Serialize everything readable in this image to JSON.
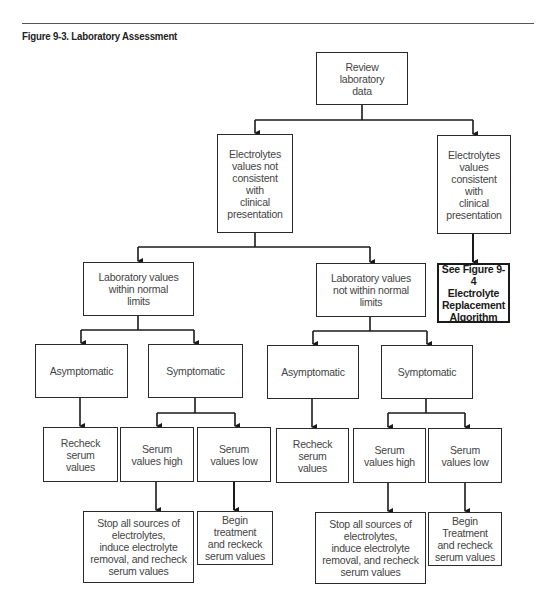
{
  "figure": {
    "title": "Figure 9-3. Laboratory Assessment"
  },
  "nodes": {
    "review": {
      "label": "Review\nlaboratory\ndata"
    },
    "not_consistent": {
      "label": "Electrolytes\nvalues not\nconsistent\nwith\nclinical\npresentation"
    },
    "consistent": {
      "label": "Electrolytes\nvalues\nconsistent\nwith\nclinical\npresentation"
    },
    "see_fig": {
      "label": "See Figure 9-4\nElectrolyte\nReplacement\nAlgorithm"
    },
    "within_limits": {
      "label": "Laboratory values\nwithin normal\nlimits"
    },
    "not_within_limits": {
      "label": "Laboratory values\nnot within normal\nlimits"
    },
    "left_asymptomatic": {
      "label": "Asymptomatic"
    },
    "left_symptomatic": {
      "label": "Symptomatic"
    },
    "right_asymptomatic": {
      "label": "Asymptomatic"
    },
    "right_symptomatic": {
      "label": "Symptomatic"
    },
    "left_recheck": {
      "label": "Recheck\nserum\nvalues"
    },
    "left_serum_high": {
      "label": "Serum\nvalues high"
    },
    "left_serum_low": {
      "label": "Serum\nvalues low"
    },
    "right_recheck": {
      "label": "Recheck\nserum\nvalues"
    },
    "right_serum_high": {
      "label": "Serum\nvalues high"
    },
    "right_serum_low": {
      "label": "Serum\nvalues low"
    },
    "left_stop": {
      "label": "Stop all sources of\nelectrolytes,\ninduce electrolyte\nremoval, and recheck\nserum values"
    },
    "left_begin": {
      "label": "Begin\ntreatment\nand reckeck\nserum values"
    },
    "right_stop": {
      "label": "Stop all sources of\nelectrolytes,\ninduce electrolyte\nremoval, and recheck\nserum values"
    },
    "right_begin": {
      "label": "Begin\nTreatment\nand recheck\nserum values"
    }
  },
  "edges": [
    [
      "review",
      "not_consistent"
    ],
    [
      "review",
      "consistent"
    ],
    [
      "consistent",
      "see_fig"
    ],
    [
      "not_consistent",
      "within_limits"
    ],
    [
      "not_consistent",
      "not_within_limits"
    ],
    [
      "within_limits",
      "left_asymptomatic"
    ],
    [
      "within_limits",
      "left_symptomatic"
    ],
    [
      "not_within_limits",
      "right_asymptomatic"
    ],
    [
      "not_within_limits",
      "right_symptomatic"
    ],
    [
      "left_asymptomatic",
      "left_recheck"
    ],
    [
      "left_symptomatic",
      "left_serum_high"
    ],
    [
      "left_symptomatic",
      "left_serum_low"
    ],
    [
      "right_asymptomatic",
      "right_recheck"
    ],
    [
      "right_symptomatic",
      "right_serum_high"
    ],
    [
      "right_symptomatic",
      "right_serum_low"
    ],
    [
      "left_serum_high",
      "left_stop"
    ],
    [
      "left_serum_low",
      "left_begin"
    ],
    [
      "right_serum_high",
      "right_stop"
    ],
    [
      "right_serum_low",
      "right_begin"
    ]
  ]
}
